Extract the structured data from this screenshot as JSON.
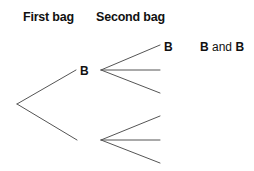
{
  "headers": {
    "first": "First bag",
    "second": "Second bag"
  },
  "tree": {
    "line_color": "#555555",
    "first_level": [
      {
        "label": "B"
      },
      {
        "label": ""
      }
    ],
    "second_level_upper": [
      {
        "label": "B",
        "outcome": {
          "part1": "B",
          "conj": " and ",
          "part2": "B"
        }
      },
      {
        "label": "",
        "outcome": null
      },
      {
        "label": "",
        "outcome": null
      }
    ],
    "second_level_lower": [
      {
        "label": ""
      },
      {
        "label": ""
      },
      {
        "label": ""
      }
    ]
  }
}
